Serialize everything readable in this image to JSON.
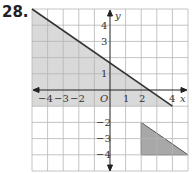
{
  "problem_number": "28.",
  "grid": {
    "xmin": -5,
    "xmax": 5,
    "ymin": -5,
    "ymax": 5
  },
  "axes": {
    "x_label": "x",
    "y_label": "y",
    "origin_label": "O"
  },
  "x_ticks": [
    "-4",
    "-3",
    "-2",
    "1",
    "2",
    "4"
  ],
  "y_ticks": [
    "4",
    "3",
    "1",
    "-2",
    "-3",
    "-4"
  ],
  "region_large": {
    "vertices": [
      [
        -5,
        5
      ],
      [
        4,
        -1
      ],
      [
        -5,
        -1
      ]
    ],
    "fill": "#d9d9d9"
  },
  "boundary_line": {
    "from": [
      -5,
      5
    ],
    "to": [
      4,
      -1
    ]
  },
  "region_small": {
    "vertices": [
      [
        2,
        -2
      ],
      [
        2,
        -4
      ],
      [
        5,
        -4
      ]
    ],
    "fill": "#a8a8a8"
  }
}
